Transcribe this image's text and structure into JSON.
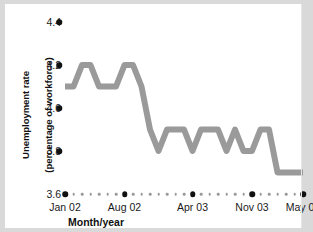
{
  "figure": {
    "background_color": "#d9d9d9",
    "panel_color": "#ffffff"
  },
  "axes": {
    "ylabel_line1": "Unemployment rate",
    "ylabel_line2": "(percentage of workforce)",
    "xlabel": "Month/year",
    "y_ticks": [
      "4.4",
      "4.2",
      "4.0",
      "3.8",
      "3.6"
    ],
    "x_ticks": [
      "Jan 02",
      "Aug 02",
      "Apr 03",
      "Nov 03",
      "May 04"
    ]
  },
  "chart_data": {
    "type": "line",
    "title": "",
    "xlabel": "Month/year",
    "ylabel": "Unemployment rate (percentage of workforce)",
    "ylim": [
      3.6,
      4.4
    ],
    "yticks": [
      3.6,
      3.8,
      4.0,
      4.2,
      4.4
    ],
    "grid": false,
    "legend": "none",
    "line_color": "#9a9a9a",
    "line_width": 6,
    "x": [
      "Jan 02",
      "Feb 02",
      "Mar 02",
      "Apr 02",
      "May 02",
      "Jun 02",
      "Jul 02",
      "Aug 02",
      "Sep 02",
      "Oct 02",
      "Nov 02",
      "Dec 02",
      "Jan 03",
      "Feb 03",
      "Mar 03",
      "Apr 03",
      "May 03",
      "Jun 03",
      "Jul 03",
      "Aug 03",
      "Sep 03",
      "Oct 03",
      "Nov 03",
      "Dec 03",
      "Jan 04",
      "Feb 04",
      "Mar 04",
      "Apr 04",
      "May 04"
    ],
    "major_tick_indices": [
      0,
      7,
      15,
      22,
      28
    ],
    "values": [
      4.1,
      4.1,
      4.2,
      4.2,
      4.1,
      4.1,
      4.1,
      4.2,
      4.2,
      4.1,
      3.9,
      3.8,
      3.9,
      3.9,
      3.9,
      3.8,
      3.9,
      3.9,
      3.9,
      3.8,
      3.9,
      3.8,
      3.8,
      3.9,
      3.9,
      3.7,
      3.7,
      3.7,
      3.7
    ]
  }
}
